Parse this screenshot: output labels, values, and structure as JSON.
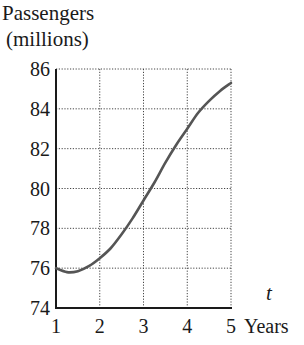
{
  "chart_data": {
    "type": "line",
    "title": "",
    "ylabel": [
      "Passengers",
      "(millions)"
    ],
    "xlabel": "Years",
    "x_variable": "t",
    "xlim": [
      1,
      5
    ],
    "ylim": [
      74,
      86
    ],
    "x_ticks": [
      1,
      2,
      3,
      4,
      5
    ],
    "y_ticks": [
      74,
      76,
      78,
      80,
      82,
      84,
      86
    ],
    "x_tick_labels": [
      "1",
      "2",
      "3",
      "4",
      "5"
    ],
    "y_tick_labels": [
      "74",
      "76",
      "78",
      "80",
      "82",
      "84",
      "86"
    ],
    "grid": true,
    "grid_style": "dotted",
    "legend": null,
    "series": [
      {
        "name": "Passengers",
        "color": "#555555",
        "x": [
          1.0,
          1.25,
          1.5,
          1.75,
          2.0,
          2.25,
          2.5,
          2.75,
          3.0,
          3.25,
          3.5,
          3.75,
          4.0,
          4.25,
          4.5,
          4.75,
          5.0
        ],
        "y": [
          76.0,
          75.8,
          75.85,
          76.1,
          76.5,
          77.0,
          77.7,
          78.5,
          79.4,
          80.3,
          81.3,
          82.2,
          83.0,
          83.8,
          84.4,
          84.9,
          85.3
        ]
      }
    ]
  }
}
